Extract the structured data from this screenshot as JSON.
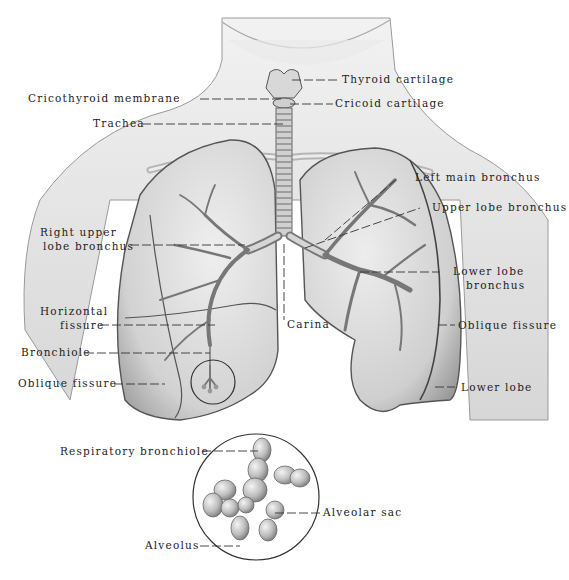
{
  "figure": {
    "labels": {
      "thyroid_cartilage": "Thyroid cartilage",
      "cricothyroid_membrane": "Cricothyroid membrane",
      "cricoid_cartilage": "Cricoid cartilage",
      "trachea": "Trachea",
      "left_main_bronchus": "Left main bronchus",
      "upper_lobe_bronchus": "Upper lobe bronchus",
      "right_upper_lobe_bronchus_1": "Right upper",
      "right_upper_lobe_bronchus_2": "lobe bronchus",
      "lower_lobe_bronchus_1": "Lower lobe",
      "lower_lobe_bronchus_2": "bronchus",
      "carina": "Carina",
      "horizontal_fissure_1": "Horizontal",
      "horizontal_fissure_2": "fissure",
      "oblique_fissure_right": "Oblique fissure",
      "oblique_fissure_left": "Oblique fissure",
      "bronchiole": "Bronchiole",
      "lower_lobe": "Lower lobe",
      "respiratory_bronchiole": "Respiratory bronchiole",
      "alveolar_sac": "Alveolar sac",
      "alveolus": "Alveolus"
    },
    "colors": {
      "background": "#ffffff",
      "ink": "#222222",
      "tissue_light": "#e6e6e6",
      "tissue_mid": "#bdbdbd",
      "tissue_dark": "#7a7a7a"
    }
  }
}
